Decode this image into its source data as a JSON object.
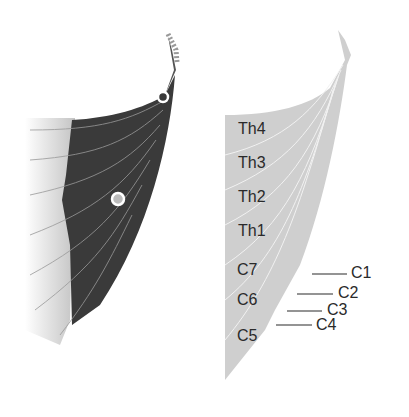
{
  "figure": {
    "left_panel": {
      "description": "dark muscle diagram with fiber lines and two circular markers",
      "markers": [
        {
          "name": "upper-marker",
          "x": 163,
          "y": 97
        },
        {
          "name": "middle-marker",
          "x": 118,
          "y": 199
        }
      ]
    },
    "right_panel": {
      "segment_labels": [
        "Th4",
        "Th3",
        "Th2",
        "Th1",
        "C7",
        "C6",
        "C5"
      ],
      "leader_labels": [
        "C1",
        "C2",
        "C3",
        "C4"
      ]
    },
    "colors": {
      "dark_muscle": "#3a3a3a",
      "light_fibers": "#c8c8c8",
      "right_fill": "#cfcfcf",
      "text": "#2a2a2a"
    }
  }
}
